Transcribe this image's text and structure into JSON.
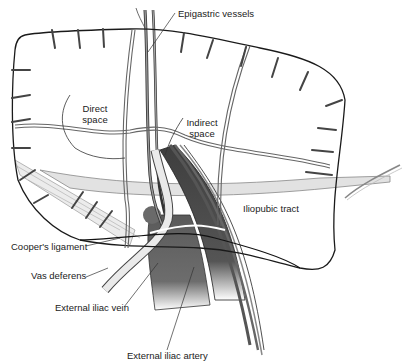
{
  "figure": {
    "type": "anatomical illustration"
  },
  "labels": {
    "epigastric_vessels": "Epigastric vessels",
    "direct_space_1": "Direct",
    "direct_space_2": "space",
    "indirect_space_1": "Indirect",
    "indirect_space_2": "space",
    "iliopubic_tract": "Iliopubic tract",
    "coopers_ligament": "Cooper's ligament",
    "vas_deferens": "Vas deferens",
    "external_iliac_vein": "External iliac vein",
    "external_iliac_artery": "External iliac artery"
  },
  "colors": {
    "outline": "#222222",
    "vessel_dark": "#4a4a4a",
    "vessel_mid": "#7a7a7a",
    "tract_fill": "#dedede",
    "vas_fill": "#e8e8e8"
  }
}
